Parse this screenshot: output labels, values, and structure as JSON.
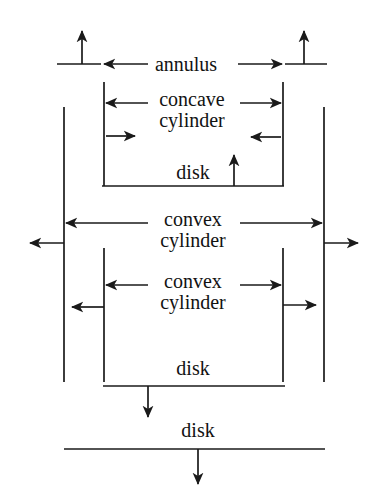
{
  "diagram": {
    "stroke_color": "#1a1a1a",
    "background": "#ffffff",
    "labels": [
      {
        "id": "annulus",
        "text": "annulus",
        "x": 186,
        "y": 64,
        "lines": [
          "annulus"
        ]
      },
      {
        "id": "concave-cylinder",
        "text": "concave cylinder",
        "x": 192,
        "y": 110,
        "lines": [
          "concave",
          "cylinder"
        ]
      },
      {
        "id": "disk-upper",
        "text": "disk",
        "x": 193,
        "y": 172,
        "lines": [
          "disk"
        ]
      },
      {
        "id": "convex-cylinder-outer",
        "text": "convex cylinder",
        "x": 193,
        "y": 230,
        "lines": [
          "convex",
          "cylinder"
        ]
      },
      {
        "id": "convex-cylinder-inner",
        "text": "convex cylinder",
        "x": 193,
        "y": 292,
        "lines": [
          "convex",
          "cylinder"
        ]
      },
      {
        "id": "disk-lower",
        "text": "disk",
        "x": 193,
        "y": 368,
        "lines": [
          "disk"
        ]
      },
      {
        "id": "disk-bottom",
        "text": "disk",
        "x": 198,
        "y": 430,
        "lines": [
          "disk"
        ]
      }
    ],
    "segments": [
      {
        "name": "annulus-left-bar",
        "x1": 57,
        "y1": 64,
        "x2": 101,
        "y2": 64
      },
      {
        "name": "annulus-right-bar",
        "x1": 285,
        "y1": 64,
        "x2": 327,
        "y2": 64
      },
      {
        "name": "inner-left-vertical-upper",
        "x1": 104,
        "y1": 82,
        "x2": 104,
        "y2": 186
      },
      {
        "name": "inner-right-vertical-upper",
        "x1": 283,
        "y1": 82,
        "x2": 283,
        "y2": 186
      },
      {
        "name": "outer-left-vertical",
        "x1": 64,
        "y1": 107,
        "x2": 64,
        "y2": 382
      },
      {
        "name": "outer-right-vertical",
        "x1": 324,
        "y1": 107,
        "x2": 324,
        "y2": 382
      },
      {
        "name": "disk-upper-bar",
        "x1": 102,
        "y1": 186,
        "x2": 284,
        "y2": 186
      },
      {
        "name": "inner-left-vertical-lower",
        "x1": 104,
        "y1": 248,
        "x2": 104,
        "y2": 382
      },
      {
        "name": "inner-right-vertical-lower",
        "x1": 283,
        "y1": 248,
        "x2": 283,
        "y2": 382
      },
      {
        "name": "disk-lower-bar",
        "x1": 103,
        "y1": 386,
        "x2": 285,
        "y2": 386
      },
      {
        "name": "disk-bottom-bar",
        "x1": 64,
        "y1": 449,
        "x2": 325,
        "y2": 449
      }
    ],
    "arrows": [
      {
        "name": "annulus-left-up-arrow",
        "x1": 82,
        "y1": 64,
        "x2": 82,
        "y2": 31,
        "dir": "up"
      },
      {
        "name": "annulus-right-up-arrow",
        "x1": 304,
        "y1": 64,
        "x2": 304,
        "y2": 31,
        "dir": "up"
      },
      {
        "name": "annulus-arrow-left",
        "x1": 148,
        "y1": 64,
        "x2": 104,
        "y2": 64,
        "dir": "left"
      },
      {
        "name": "annulus-arrow-right",
        "x1": 238,
        "y1": 64,
        "x2": 282,
        "y2": 64,
        "dir": "right"
      },
      {
        "name": "concave-cyl-arrow-left-out",
        "x1": 148,
        "y1": 103,
        "x2": 106,
        "y2": 103,
        "dir": "left"
      },
      {
        "name": "concave-cyl-arrow-right-out",
        "x1": 240,
        "y1": 103,
        "x2": 281,
        "y2": 103,
        "dir": "right"
      },
      {
        "name": "concave-cyl-arrow-left-in",
        "x1": 106,
        "y1": 136,
        "x2": 135,
        "y2": 136,
        "dir": "right"
      },
      {
        "name": "concave-cyl-arrow-right-in",
        "x1": 281,
        "y1": 137,
        "x2": 251,
        "y2": 137,
        "dir": "left"
      },
      {
        "name": "disk-upper-arrow-up",
        "x1": 234,
        "y1": 186,
        "x2": 234,
        "y2": 155,
        "dir": "up"
      },
      {
        "name": "convex-outer-arrow-left",
        "x1": 148,
        "y1": 223,
        "x2": 66,
        "y2": 223,
        "dir": "left"
      },
      {
        "name": "convex-outer-arrow-right",
        "x1": 240,
        "y1": 223,
        "x2": 322,
        "y2": 223,
        "dir": "right"
      },
      {
        "name": "outer-left-escape-arrow",
        "x1": 64,
        "y1": 243,
        "x2": 30,
        "y2": 243,
        "dir": "left"
      },
      {
        "name": "outer-right-escape-arrow",
        "x1": 324,
        "y1": 243,
        "x2": 358,
        "y2": 243,
        "dir": "right"
      },
      {
        "name": "convex-inner-arrow-left",
        "x1": 148,
        "y1": 285,
        "x2": 106,
        "y2": 285,
        "dir": "left"
      },
      {
        "name": "convex-inner-arrow-right",
        "x1": 240,
        "y1": 285,
        "x2": 281,
        "y2": 285,
        "dir": "right"
      },
      {
        "name": "inner-left-escape-arrow",
        "x1": 104,
        "y1": 307,
        "x2": 72,
        "y2": 307,
        "dir": "left"
      },
      {
        "name": "inner-right-escape-arrow",
        "x1": 283,
        "y1": 305,
        "x2": 316,
        "y2": 305,
        "dir": "right"
      },
      {
        "name": "disk-lower-arrow-down",
        "x1": 148,
        "y1": 386,
        "x2": 148,
        "y2": 417,
        "dir": "down"
      },
      {
        "name": "disk-bottom-arrow-down",
        "x1": 198,
        "y1": 449,
        "x2": 198,
        "y2": 484,
        "dir": "down"
      }
    ]
  }
}
